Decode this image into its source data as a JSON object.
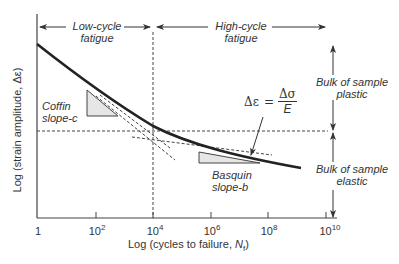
{
  "diagram": {
    "type": "strain-life fatigue curve (log-log)",
    "regions": {
      "low_cycle": {
        "line1": "Low-cycle",
        "line2": "fatigue"
      },
      "high_cycle": {
        "line1": "High-cycle",
        "line2": "fatigue"
      }
    },
    "right_labels": {
      "plastic": {
        "line1": "Bulk of sample",
        "line2": "plastic"
      },
      "elastic": {
        "line1": "Bulk of sample",
        "line2": "elastic"
      }
    },
    "slopes": {
      "coffin": {
        "line1": "Coffin",
        "line2": "slope-c"
      },
      "basquin": {
        "line1": "Basquin",
        "line2": "slope-b"
      }
    },
    "formula": {
      "lhs": "Δε",
      "equals": "=",
      "numerator": "Δσ",
      "denominator": "E"
    },
    "axes": {
      "x_label": "Log (cycles to failure, ",
      "x_label_var": "N",
      "x_label_sub": "f",
      "x_label_end": ")",
      "y_label": "Log (strain amplitude, Δε)",
      "x_ticks": [
        {
          "base": "1",
          "exp": ""
        },
        {
          "base": "10",
          "exp": "2"
        },
        {
          "base": "10",
          "exp": "4"
        },
        {
          "base": "10",
          "exp": "6"
        },
        {
          "base": "10",
          "exp": "8"
        },
        {
          "base": "10",
          "exp": "10"
        }
      ]
    },
    "transition_life": "10^4",
    "colors": {
      "curve": "#222222",
      "axis": "#444444",
      "dashed": "#444444",
      "triangle_fill": "#e6e6e6",
      "text": "#333333"
    }
  }
}
